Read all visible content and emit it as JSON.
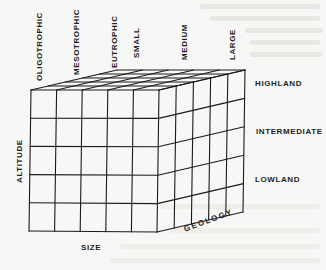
{
  "diagram": {
    "type": "3d-grid-cube",
    "front_face": {
      "columns": 5,
      "rows": 5
    },
    "depth_divisions": 5,
    "line_color": "#1a1a1a",
    "background_color": "#f7f7f5"
  },
  "axes": {
    "vertical": {
      "title": "ALTITUDE",
      "levels": [
        "HIGHLAND",
        "INTERMEDIATE",
        "LOWLAND"
      ]
    },
    "horizontal": {
      "title": "SIZE",
      "levels": [
        "SMALL",
        "MEDIUM",
        "LARGE"
      ]
    },
    "depth": {
      "title": "GEOLOGY",
      "levels": [
        "OLIGOTROPHIC",
        "MESOTROPHIC",
        "EUTROPHIC"
      ]
    }
  }
}
